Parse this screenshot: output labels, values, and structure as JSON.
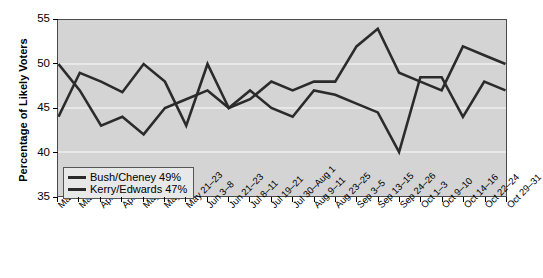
{
  "chart_data": {
    "type": "line",
    "title": "",
    "xlabel": "",
    "ylabel": "Percentage of Likely Voters",
    "ylim": [
      35,
      55
    ],
    "yticks": [
      55,
      50,
      45,
      40,
      35
    ],
    "grid": true,
    "legend_position": "bottom-left",
    "categories": [
      "Mar 5–7",
      "Mar 26–28",
      "Apr 5–8",
      "Apr 16–18",
      "May 2–4",
      "May 7–9",
      "May 21–23",
      "Jun 3–8",
      "Jun 21–23",
      "Jul 8–11",
      "Jul 19–21",
      "Jul 30–Aug 1",
      "Aug 9–11",
      "Aug 23–25",
      "Sep 3–5",
      "Sep 13–15",
      "Sep 24–26",
      "Oct 1–3",
      "Oct 9–10",
      "Oct 14–16",
      "Oct 22–24",
      "Oct 29–31"
    ],
    "series": [
      {
        "name": "Bush/Cheney",
        "color": "#2b2b2b",
        "values": [
          50,
          47,
          43,
          44,
          42,
          45,
          46,
          47,
          45,
          46,
          48,
          47,
          48,
          48,
          52,
          54,
          49,
          48,
          47,
          52,
          51,
          50
        ]
      },
      {
        "name": "Kerry/Edwards",
        "color": "#2b2b2b",
        "values": [
          44,
          49,
          48,
          46.8,
          50,
          48,
          43,
          50,
          45,
          47,
          45,
          44,
          47,
          46.5,
          45.5,
          44.5,
          40,
          48.5,
          48.5,
          44,
          48,
          47
        ]
      }
    ]
  },
  "legend": {
    "items": [
      {
        "label": "Bush/Cheney 49%"
      },
      {
        "label": "Kerry/Edwards 47%"
      }
    ]
  },
  "axis": {
    "y_title": "Percentage of Likely Voters"
  },
  "colors": {
    "plot_background": "#d4d4d4",
    "line": "#2b2b2b",
    "gridline": "#efefef",
    "frame": "#4a4a4a"
  }
}
